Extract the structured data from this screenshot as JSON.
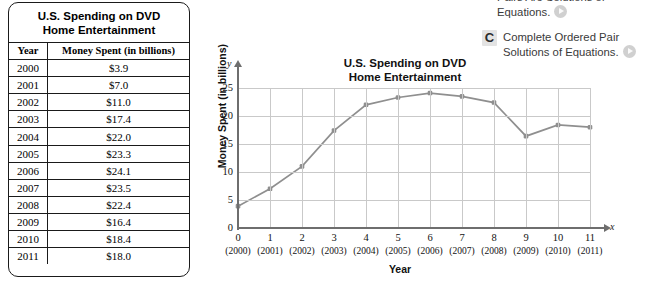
{
  "table": {
    "title_line1": "U.S. Spending on DVD",
    "title_line2": "Home Entertainment",
    "headers": [
      "Year",
      "Money Spent (in billions)"
    ],
    "rows": [
      [
        "2000",
        "$3.9"
      ],
      [
        "2001",
        "$7.0"
      ],
      [
        "2002",
        "$11.0"
      ],
      [
        "2003",
        "$17.4"
      ],
      [
        "2004",
        "$22.0"
      ],
      [
        "2005",
        "$23.3"
      ],
      [
        "2006",
        "$24.1"
      ],
      [
        "2007",
        "$23.5"
      ],
      [
        "2008",
        "$22.4"
      ],
      [
        "2009",
        "$16.4"
      ],
      [
        "2010",
        "$18.4"
      ],
      [
        "2011",
        "$18.0"
      ]
    ]
  },
  "chart": {
    "title_line1": "U.S. Spending on DVD",
    "title_line2": "Home Entertainment",
    "y_axis_letter": "y",
    "x_axis_letter": "x"
  },
  "chart_data": {
    "type": "line",
    "title": "U.S. Spending on DVD Home Entertainment",
    "xlabel": "Year",
    "ylabel": "Money Spent (in billions)",
    "x": [
      0,
      1,
      2,
      3,
      4,
      5,
      6,
      7,
      8,
      9,
      10,
      11
    ],
    "x_tick_labels": [
      "0",
      "1",
      "2",
      "3",
      "4",
      "5",
      "6",
      "7",
      "8",
      "9",
      "10",
      "11"
    ],
    "x_tick_sublabels": [
      "(2000)",
      "(2001)",
      "(2002)",
      "(2003)",
      "(2004)",
      "(2005)",
      "(2006)",
      "(2007)",
      "(2008)",
      "(2009)",
      "(2010)",
      "(2011)"
    ],
    "values": [
      3.9,
      7.0,
      11.0,
      17.4,
      22.0,
      23.3,
      24.1,
      23.5,
      22.4,
      16.4,
      18.4,
      18.0
    ],
    "y_tick_labels": [
      "0",
      "5",
      "10",
      "15",
      "20",
      "25"
    ],
    "y_ticks": [
      0,
      5,
      10,
      15,
      20,
      25
    ],
    "xlim": [
      0,
      11
    ],
    "ylim": [
      0,
      25
    ],
    "grid": true,
    "legend": "none",
    "line_color": "#8f8f8f",
    "marker_color": "#8f8f8f"
  },
  "right_panel": {
    "item_partial": {
      "line1": "Pairs Are Solutions of",
      "line2": "Equations."
    },
    "item_c": {
      "badge": "C",
      "line1": "Complete Ordered Pair",
      "line2": "Solutions of Equations."
    }
  }
}
